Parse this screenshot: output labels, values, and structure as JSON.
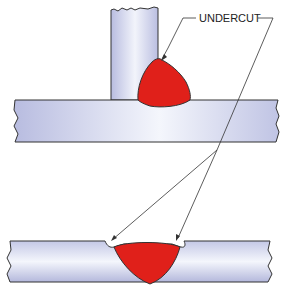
{
  "diagram": {
    "label": "UNDERCUT",
    "colors": {
      "weld": "#e0201a",
      "metal_light": "#f4f6fc",
      "metal_dark": "#b4b8dc",
      "outline": "#333333"
    },
    "parts": [
      "fillet-weld-tee-joint",
      "groove-weld-butt-joint"
    ]
  }
}
